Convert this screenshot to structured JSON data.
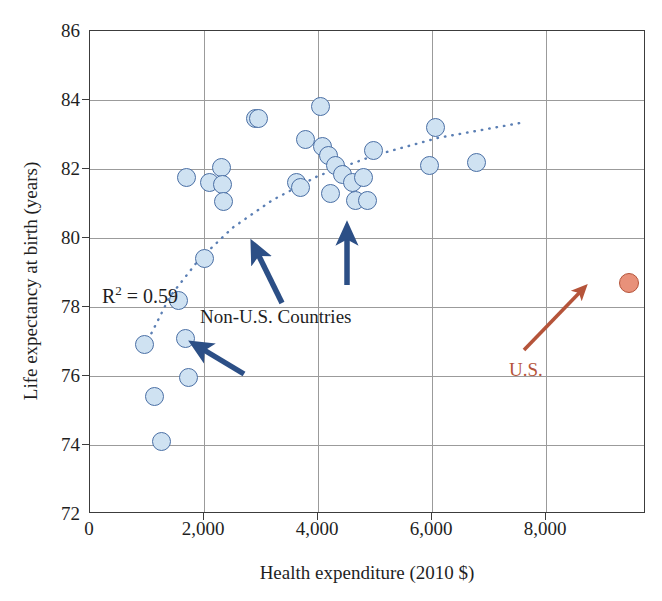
{
  "chart_data": {
    "type": "scatter",
    "title": "",
    "xlabel": "Health expenditure (2010 $)",
    "ylabel": "Life expectancy at birth (years)",
    "xlim": [
      0,
      9750
    ],
    "ylim": [
      72,
      86
    ],
    "xticks": [
      0,
      2000,
      4000,
      6000,
      8000
    ],
    "xticklabels": [
      "0",
      "2,000",
      "4,000",
      "6,000",
      "8,000"
    ],
    "yticks": [
      72,
      74,
      76,
      78,
      80,
      82,
      84,
      86
    ],
    "yticklabels": [
      "72",
      "74",
      "76",
      "78",
      "80",
      "82",
      "84",
      "86"
    ],
    "grid": true,
    "legend_position": "none",
    "annotations": {
      "r2_text": "R",
      "r2_exponent": "2",
      "r2_value": " = 0.59",
      "r2_full": "R² = 0.59",
      "nonus_label": "Non-U.S. Countries",
      "us_label": "U.S."
    },
    "colors": {
      "nonus_fill": "#cfe2f2",
      "nonus_stroke": "#4a6fa5",
      "us_fill": "#e8917a",
      "us_stroke": "#b5543a",
      "arrow_nonus": "#2c4f86",
      "arrow_us": "#b5543a",
      "trendline": "#5b7fb4",
      "gridline": "#9b9b9b",
      "frame": "#3c3c3c"
    },
    "series": [
      {
        "name": "Non-U.S. Countries",
        "marker": "circle",
        "points": [
          {
            "x": 960,
            "y": 76.9
          },
          {
            "x": 1130,
            "y": 75.4
          },
          {
            "x": 1260,
            "y": 74.1
          },
          {
            "x": 1560,
            "y": 78.2
          },
          {
            "x": 1680,
            "y": 77.1
          },
          {
            "x": 1700,
            "y": 81.75
          },
          {
            "x": 1730,
            "y": 75.95
          },
          {
            "x": 2000,
            "y": 79.4
          },
          {
            "x": 2100,
            "y": 81.6
          },
          {
            "x": 2310,
            "y": 82.05
          },
          {
            "x": 2330,
            "y": 81.55
          },
          {
            "x": 2340,
            "y": 81.05
          },
          {
            "x": 2900,
            "y": 83.45
          },
          {
            "x": 2960,
            "y": 83.45
          },
          {
            "x": 3620,
            "y": 81.6
          },
          {
            "x": 3700,
            "y": 81.45
          },
          {
            "x": 3780,
            "y": 82.85
          },
          {
            "x": 4050,
            "y": 83.8
          },
          {
            "x": 4080,
            "y": 82.65
          },
          {
            "x": 4180,
            "y": 82.4
          },
          {
            "x": 4220,
            "y": 81.3
          },
          {
            "x": 4300,
            "y": 82.1
          },
          {
            "x": 4420,
            "y": 81.85
          },
          {
            "x": 4600,
            "y": 81.6
          },
          {
            "x": 4660,
            "y": 81.1
          },
          {
            "x": 4800,
            "y": 81.75
          },
          {
            "x": 4860,
            "y": 81.1
          },
          {
            "x": 4970,
            "y": 82.55
          },
          {
            "x": 6050,
            "y": 83.2
          },
          {
            "x": 5960,
            "y": 82.1
          },
          {
            "x": 6780,
            "y": 82.2
          }
        ]
      },
      {
        "name": "U.S.",
        "marker": "circle",
        "points": [
          {
            "x": 9450,
            "y": 78.7
          }
        ]
      }
    ],
    "trendline": {
      "style": "dotted",
      "description": "logarithmic fit through non-U.S. countries",
      "r_squared": 0.59,
      "points": [
        {
          "x": 960,
          "y": 76.85
        },
        {
          "x": 1400,
          "y": 78.3
        },
        {
          "x": 1900,
          "y": 79.35
        },
        {
          "x": 2500,
          "y": 80.3
        },
        {
          "x": 3200,
          "y": 81.1
        },
        {
          "x": 4000,
          "y": 81.8
        },
        {
          "x": 5000,
          "y": 82.4
        },
        {
          "x": 6100,
          "y": 82.9
        },
        {
          "x": 7600,
          "y": 83.35
        }
      ]
    }
  }
}
